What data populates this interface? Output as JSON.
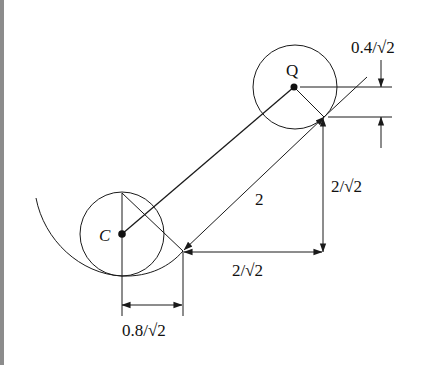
{
  "figure": {
    "type": "geometry-dimension-diagram",
    "colors": {
      "background": "#ffffff",
      "ink": "#1a1a1a",
      "edge_bar": "#8c8c8c"
    },
    "points": {
      "C": {
        "label": "C",
        "x": 122,
        "y": 234
      },
      "Q": {
        "label": "Q",
        "x": 294,
        "y": 87
      }
    },
    "circles": [
      {
        "name": "circle-C",
        "cx": 122,
        "cy": 234,
        "r": 42
      },
      {
        "name": "circle-Q",
        "cx": 295,
        "cy": 87,
        "r": 42
      }
    ],
    "labels": {
      "point_c": "C",
      "point_q": "Q",
      "dim_top_right": "0.4/√2",
      "dim_diagonal": "2",
      "dim_vertical": "2/√2",
      "dim_horizontal": "2/√2",
      "dim_bottom": "0.8/√2"
    },
    "dimensions": [
      {
        "name": "offset-top-right",
        "label": "0.4/√2",
        "orientation": "vertical"
      },
      {
        "name": "diagonal-length",
        "label": "2",
        "orientation": "diagonal"
      },
      {
        "name": "vertical-rise",
        "label": "2/√2",
        "orientation": "vertical"
      },
      {
        "name": "horizontal-run",
        "label": "2/√2",
        "orientation": "horizontal"
      },
      {
        "name": "offset-bottom",
        "label": "0.8/√2",
        "orientation": "horizontal"
      }
    ]
  }
}
